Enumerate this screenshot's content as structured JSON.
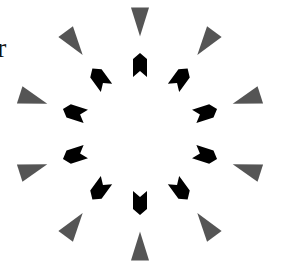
{
  "stray_text": "r",
  "figure": {
    "center": [
      140,
      134
    ],
    "count": 10,
    "angle_step_deg": 36,
    "outer": {
      "radius": 112,
      "color": "#555555",
      "shape": "triangle-pointing-inward",
      "base": 18,
      "length": 29
    },
    "inner": {
      "radius": 69,
      "color": "#000000",
      "shape": "notched-arrow-pointing-outward",
      "width": 14,
      "length": 24
    }
  }
}
